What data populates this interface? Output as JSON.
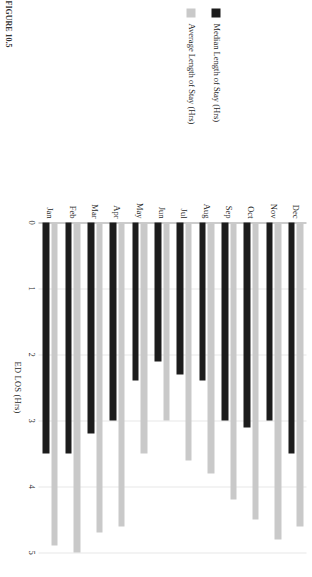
{
  "figure": {
    "caption": "FIGURE 10.5"
  },
  "legend": {
    "position": "top-left",
    "items": [
      {
        "label": "Median Length of Stay (Hrs)",
        "color": "#1c1c1c",
        "icon": "legend-swatch-icon"
      },
      {
        "label": "Average Length of Stay (Hrs)",
        "color": "#c9c9c9",
        "icon": "legend-swatch-icon"
      }
    ]
  },
  "axes": {
    "value_axis_title": "ED LOS (Hrs)",
    "tick_labels": [
      "0",
      "1",
      "2",
      "3",
      "4",
      "5"
    ],
    "category_axis_title": ""
  },
  "chart_data": {
    "type": "bar",
    "orientation": "horizontal",
    "title": "",
    "xlabel": "ED LOS (Hrs)",
    "ylabel": "",
    "xlim": [
      0,
      5
    ],
    "grid": true,
    "legend_position": "top-left",
    "categories": [
      "Jan",
      "Feb",
      "Mar",
      "Apr",
      "May",
      "Jun",
      "Jul",
      "Aug",
      "Sep",
      "Oct",
      "Nov",
      "Dec"
    ],
    "series": [
      {
        "name": "Median Length of Stay (Hrs)",
        "color": "#1c1c1c",
        "values": [
          3.5,
          3.5,
          3.2,
          3.0,
          2.4,
          2.1,
          2.3,
          2.4,
          3.0,
          3.1,
          3.0,
          3.5
        ]
      },
      {
        "name": "Average Length of Stay (Hrs)",
        "color": "#c9c9c9",
        "values": [
          4.9,
          5.0,
          4.7,
          4.6,
          3.5,
          3.0,
          3.6,
          3.8,
          4.2,
          4.5,
          4.8,
          4.6
        ]
      }
    ]
  }
}
